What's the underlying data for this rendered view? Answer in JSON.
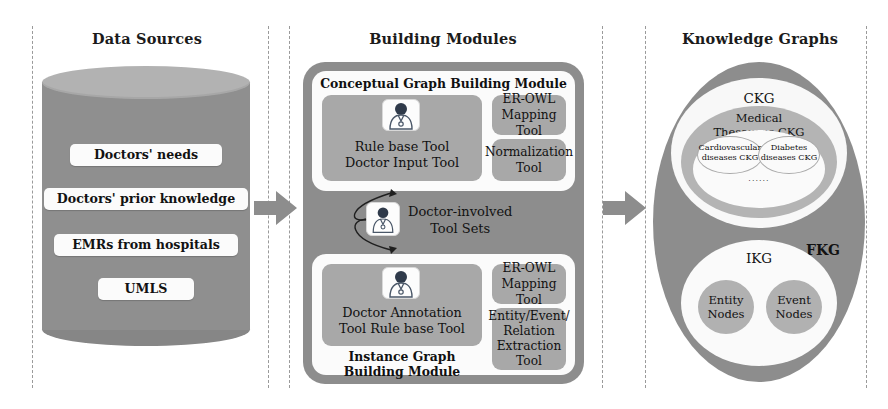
{
  "sections": {
    "data_sources": {
      "title": "Data Sources",
      "items": [
        "Doctors' needs",
        "Doctors' prior knowledge",
        "EMRs from hospitals",
        "UMLS"
      ]
    },
    "building_modules": {
      "title": "Building Modules",
      "conceptual": {
        "title": "Conceptual Graph Building Module",
        "main_tool_line1": "Rule base Tool",
        "main_tool_line2": "Doctor Input Tool",
        "side_tools": [
          {
            "line1": "ER-OWL",
            "line2": "Mapping Tool"
          },
          {
            "line1": "Normalization",
            "line2": "Tool"
          }
        ]
      },
      "middle_label": {
        "line1": "Doctor-involved",
        "line2": "Tool Sets"
      },
      "instance": {
        "title_line1": "Instance Graph",
        "title_line2": "Building Module",
        "main_tool_line1": "Doctor Annotation",
        "main_tool_line2": "Tool Rule base Tool",
        "side_tools": [
          {
            "line1": "ER-OWL",
            "line2": "Mapping Tool"
          },
          {
            "line1": "Entity/Event/",
            "line2": "Relation",
            "line3": "Extraction",
            "line4": "Tool"
          }
        ]
      }
    },
    "knowledge_graphs": {
      "title": "Knowledge Graphs",
      "fkg_label": "FKG",
      "ckg_label": "CKG",
      "thesaurus_line1": "Medical",
      "thesaurus_line2": "Thesaurus CKG",
      "leaf_left_line1": "Cardiovascular",
      "leaf_left_line2": "diseases CKG",
      "leaf_right_line1": "Diabetes",
      "leaf_right_line2": "diseases CKG",
      "ellipsis": "......",
      "ikg_label": "IKG",
      "entity_line1": "Entity",
      "entity_line2": "Nodes",
      "event_line1": "Event",
      "event_line2": "Nodes"
    }
  },
  "icons": {
    "doctor": "doctor-icon",
    "arrow": "right-arrow-icon"
  },
  "colors": {
    "cylinder_body": "#8f8f8f",
    "cylinder_top": "#b2b2b2",
    "module_outer": "#8d8d8d",
    "module_inner": "#fbfbfb",
    "tool_box": "#a8a8a8",
    "arrow": "#8d8d8d",
    "divider": "#9a9a9a",
    "text": "#121212"
  }
}
